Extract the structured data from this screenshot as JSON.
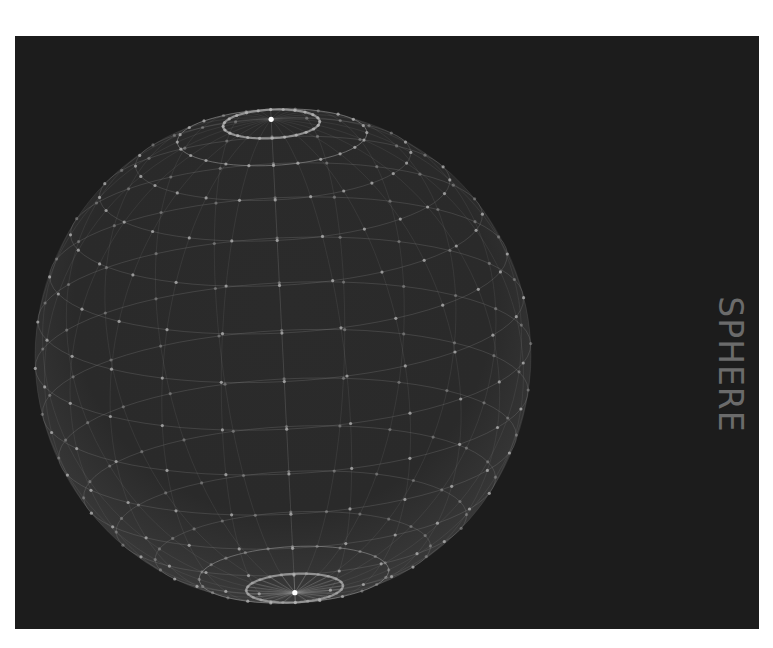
{
  "viewport": {
    "background_color": "#1c1c1c",
    "label": "SPHERE",
    "label_color": "#6b6b6b"
  },
  "sphere": {
    "name": "sphere",
    "render_mode": "wireframe",
    "wire_color": "#9a9a9a",
    "vertex_color": "#b8b8b8",
    "pole_color": "#ffffff",
    "fill_color": "#2e2e2e",
    "latitude_rings": 16,
    "meridians": 24
  }
}
